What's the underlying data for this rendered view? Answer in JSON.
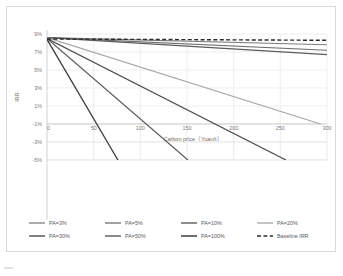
{
  "figure": {
    "caption": "",
    "caption_visible": false
  },
  "chart_data": {
    "type": "line",
    "title": "",
    "xlabel": "Carbon price（Yuan/t）",
    "ylabel": "IRR",
    "xlim": [
      0,
      300
    ],
    "ylim": [
      -5,
      9
    ],
    "xticks": [
      0,
      50,
      100,
      150,
      200,
      250,
      300
    ],
    "xtick_labels": [
      "0",
      "50",
      "100",
      "150",
      "200",
      "250",
      "300"
    ],
    "yticks": [
      9,
      7,
      5,
      3,
      1,
      -1,
      -3,
      -5
    ],
    "ytick_labels": [
      "9%",
      "7%",
      "5%",
      "3%",
      "1%",
      "-1%",
      "-3%",
      "-5%"
    ],
    "grid": true,
    "legend_position": "bottom",
    "series": [
      {
        "name": "PA=3%",
        "color": "#7f7f7f",
        "width": 1.1,
        "dash": "none",
        "x": [
          0,
          300
        ],
        "values": [
          8.6,
          7.8
        ]
      },
      {
        "name": "PA=5%",
        "color": "#6e6e6e",
        "width": 1.1,
        "dash": "none",
        "x": [
          0,
          300
        ],
        "values": [
          8.6,
          7.2
        ]
      },
      {
        "name": "PA=10%",
        "color": "#5c5c5c",
        "width": 1.2,
        "dash": "none",
        "x": [
          0,
          300
        ],
        "values": [
          8.6,
          6.7
        ]
      },
      {
        "name": "PA=20%",
        "color": "#a6a6a6",
        "width": 1.1,
        "dash": "none",
        "x": [
          0,
          293
        ],
        "values": [
          8.6,
          -1.0
        ]
      },
      {
        "name": "PA=30%",
        "color": "#4a4a4a",
        "width": 1.2,
        "dash": "none",
        "x": [
          0,
          256
        ],
        "values": [
          8.5,
          -5.0
        ]
      },
      {
        "name": "PA=50%",
        "color": "#5a5a5a",
        "width": 1.2,
        "dash": "none",
        "x": [
          0,
          151
        ],
        "values": [
          8.5,
          -5.0
        ]
      },
      {
        "name": "PA=100%",
        "color": "#3d3d3d",
        "width": 1.3,
        "dash": "none",
        "x": [
          0,
          76
        ],
        "values": [
          8.4,
          -5.0
        ]
      },
      {
        "name": "Baseline IRR",
        "color": "#2b2b2b",
        "width": 1.4,
        "dash": "4,2.4",
        "x": [
          0,
          300
        ],
        "values": [
          8.45,
          8.3
        ]
      }
    ]
  },
  "legend": {
    "items": [
      {
        "label": "PA=3%"
      },
      {
        "label": "PA=5%"
      },
      {
        "label": "PA=10%"
      },
      {
        "label": "PA=20%"
      },
      {
        "label": "PA=30%"
      },
      {
        "label": "PA=50%"
      },
      {
        "label": "PA=100%"
      },
      {
        "label": "Baseline IRR"
      }
    ]
  }
}
